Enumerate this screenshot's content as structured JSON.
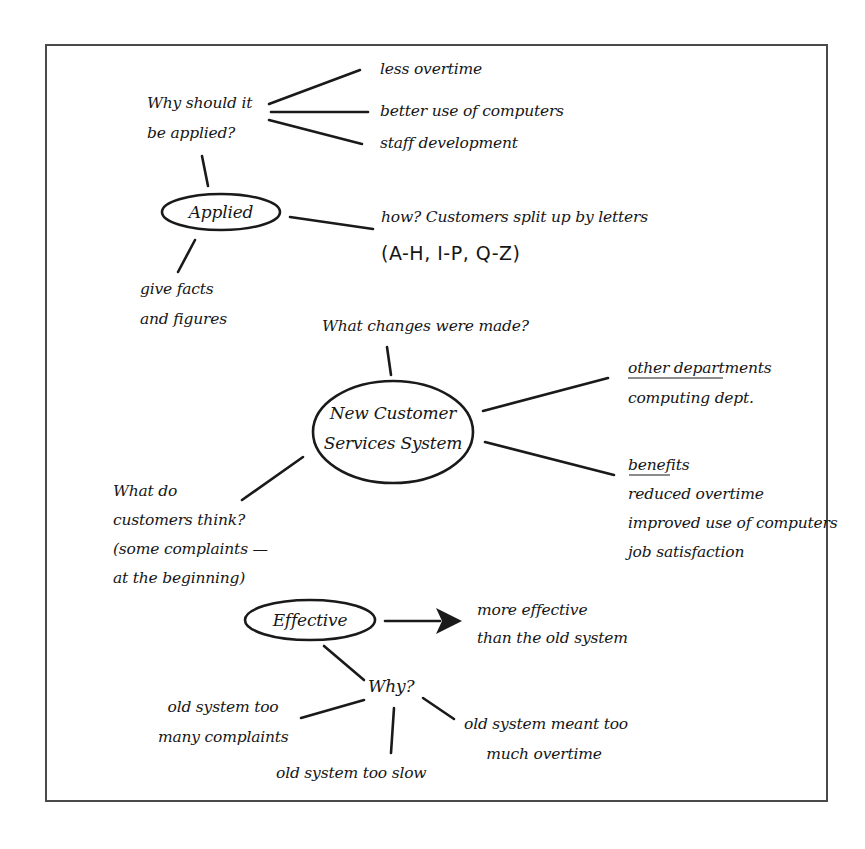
{
  "diagram": {
    "type": "mind-map",
    "colors": {
      "ink": "#161616",
      "frame": "#4a4a4a",
      "background": "#ffffff"
    },
    "nodes": {
      "applied": {
        "label": "Applied"
      },
      "center": {
        "line1": "New Customer",
        "line2": "Services System"
      },
      "effective": {
        "label": "Effective"
      },
      "why": {
        "label": "Why?"
      }
    },
    "notes": {
      "why_applied": {
        "line1": "Why should it",
        "line2": "be applied?"
      },
      "reasons": [
        "less overtime",
        "better use of computers",
        "staff development"
      ],
      "how": {
        "line1": "how? Customers split up by letters",
        "line2": "(A-H, I-P, Q-Z)"
      },
      "facts": {
        "line1": "give facts",
        "line2": "and figures"
      },
      "changes": "What changes were made?",
      "other_departments": {
        "heading": "other departments",
        "line1": "computing dept."
      },
      "benefits": {
        "heading": "benefits",
        "items": [
          "reduced overtime",
          "improved use of computers",
          "job satisfaction"
        ]
      },
      "customers": {
        "lines": [
          "What do",
          "customers think?",
          "(some complaints —",
          "at the beginning)"
        ]
      },
      "more_effective": {
        "line1": "more effective",
        "line2": "than the old system"
      },
      "complaints": {
        "line1": "old system too",
        "line2": "many complaints"
      },
      "slow": "old system too slow",
      "overtime": {
        "line1": "old system meant too",
        "line2": "much overtime"
      }
    }
  }
}
